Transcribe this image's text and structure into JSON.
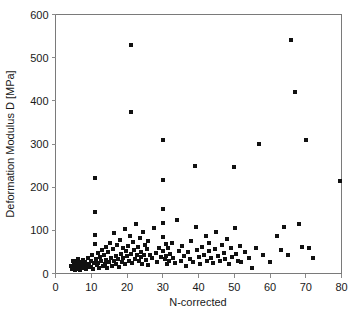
{
  "chart_data": {
    "type": "scatter",
    "title": "",
    "xlabel": "N-corrected",
    "ylabel": "Deformation Modulus D [MPa]",
    "xlim": [
      0,
      80
    ],
    "ylim": [
      0,
      600
    ],
    "xticks": [
      0,
      10,
      20,
      30,
      40,
      50,
      60,
      70,
      80
    ],
    "yticks": [
      0,
      100,
      200,
      300,
      400,
      500,
      600
    ],
    "grid": false,
    "legend": null,
    "marker": {
      "shape": "square",
      "color": "#111111",
      "size": 4
    },
    "series": [
      {
        "name": "Deformation modulus vs N-corrected",
        "points": [
          [
            4.4,
            18
          ],
          [
            4.6,
            10
          ],
          [
            4.8,
            28
          ],
          [
            5.0,
            14
          ],
          [
            5.2,
            22
          ],
          [
            5.4,
            8
          ],
          [
            5.6,
            30
          ],
          [
            5.8,
            16
          ],
          [
            6.0,
            24
          ],
          [
            6.2,
            11
          ],
          [
            6.4,
            34
          ],
          [
            6.6,
            19
          ],
          [
            6.8,
            9
          ],
          [
            7.0,
            26
          ],
          [
            7.2,
            15
          ],
          [
            7.4,
            21
          ],
          [
            7.6,
            32
          ],
          [
            7.8,
            12
          ],
          [
            8.0,
            18
          ],
          [
            8.2,
            27
          ],
          [
            8.5,
            10
          ],
          [
            8.8,
            23
          ],
          [
            9.0,
            36
          ],
          [
            9.2,
            14
          ],
          [
            9.5,
            20
          ],
          [
            9.8,
            29
          ],
          [
            10.0,
            16
          ],
          [
            10.2,
            42
          ],
          [
            10.5,
            11
          ],
          [
            10.8,
            25
          ],
          [
            11.0,
            222
          ],
          [
            11.0,
            143
          ],
          [
            11.0,
            90
          ],
          [
            11.0,
            68
          ],
          [
            11.2,
            33
          ],
          [
            11.5,
            19
          ],
          [
            11.8,
            47
          ],
          [
            12.0,
            24
          ],
          [
            12.2,
            13
          ],
          [
            12.5,
            38
          ],
          [
            12.8,
            28
          ],
          [
            13.0,
            55
          ],
          [
            13.2,
            17
          ],
          [
            13.5,
            44
          ],
          [
            13.8,
            22
          ],
          [
            14.0,
            62
          ],
          [
            14.2,
            31
          ],
          [
            14.5,
            12
          ],
          [
            14.8,
            49
          ],
          [
            15.0,
            26
          ],
          [
            15.3,
            71
          ],
          [
            15.5,
            35
          ],
          [
            15.8,
            18
          ],
          [
            16.0,
            57
          ],
          [
            16.3,
            29
          ],
          [
            16.5,
            94
          ],
          [
            16.8,
            41
          ],
          [
            17.0,
            23
          ],
          [
            17.3,
            66
          ],
          [
            17.5,
            33
          ],
          [
            17.8,
            15
          ],
          [
            18.0,
            78
          ],
          [
            18.3,
            46
          ],
          [
            18.5,
            27
          ],
          [
            18.8,
            59
          ],
          [
            19.0,
            36
          ],
          [
            19.3,
            102
          ],
          [
            19.5,
            21
          ],
          [
            19.8,
            51
          ],
          [
            20.0,
            40
          ],
          [
            20.3,
            64
          ],
          [
            20.5,
            30
          ],
          [
            20.8,
            88
          ],
          [
            21.0,
            530
          ],
          [
            21.0,
            375
          ],
          [
            21.2,
            45
          ],
          [
            21.5,
            25
          ],
          [
            21.8,
            72
          ],
          [
            22.0,
            54
          ],
          [
            22.3,
            34
          ],
          [
            22.5,
            115
          ],
          [
            22.8,
            43
          ],
          [
            23.0,
            61
          ],
          [
            23.3,
            28
          ],
          [
            23.5,
            83
          ],
          [
            23.8,
            38
          ],
          [
            24.0,
            50
          ],
          [
            24.3,
            23
          ],
          [
            24.5,
            97
          ],
          [
            24.8,
            42
          ],
          [
            25.0,
            67
          ],
          [
            25.3,
            31
          ],
          [
            25.5,
            56
          ],
          [
            25.8,
            20
          ],
          [
            26.0,
            75
          ],
          [
            26.5,
            44
          ],
          [
            27.0,
            35
          ],
          [
            27.5,
            105
          ],
          [
            28.0,
            48
          ],
          [
            28.5,
            26
          ],
          [
            29.0,
            60
          ],
          [
            29.5,
            39
          ],
          [
            30.0,
            310
          ],
          [
            30.0,
            217
          ],
          [
            30.0,
            150
          ],
          [
            30.0,
            118
          ],
          [
            30.0,
            85
          ],
          [
            30.2,
            52
          ],
          [
            30.5,
            33
          ],
          [
            30.8,
            68
          ],
          [
            31.0,
            41
          ],
          [
            31.3,
            22
          ],
          [
            31.5,
            58
          ],
          [
            31.8,
            30
          ],
          [
            32.0,
            46
          ],
          [
            32.5,
            71
          ],
          [
            33.0,
            36
          ],
          [
            33.5,
            25
          ],
          [
            34.0,
            124
          ],
          [
            34.5,
            53
          ],
          [
            35.0,
            29
          ],
          [
            35.5,
            64
          ],
          [
            36.0,
            40
          ],
          [
            36.5,
            18
          ],
          [
            37.0,
            49
          ],
          [
            37.5,
            33
          ],
          [
            38.0,
            76
          ],
          [
            38.5,
            27
          ],
          [
            39.0,
            250
          ],
          [
            39.2,
            108
          ],
          [
            39.5,
            55
          ],
          [
            40.0,
            38
          ],
          [
            40.5,
            21
          ],
          [
            41.0,
            62
          ],
          [
            41.5,
            44
          ],
          [
            42.0,
            88
          ],
          [
            42.3,
            30
          ],
          [
            42.8,
            51
          ],
          [
            43.0,
            70
          ],
          [
            43.5,
            35
          ],
          [
            44.0,
            24
          ],
          [
            44.5,
            57
          ],
          [
            45.0,
            96
          ],
          [
            45.5,
            41
          ],
          [
            46.0,
            28
          ],
          [
            46.5,
            66
          ],
          [
            47.0,
            47
          ],
          [
            47.5,
            33
          ],
          [
            48.0,
            79
          ],
          [
            48.5,
            22
          ],
          [
            49.0,
            58
          ],
          [
            49.5,
            38
          ],
          [
            50.0,
            247
          ],
          [
            50.2,
            106
          ],
          [
            50.5,
            45
          ],
          [
            51.0,
            30
          ],
          [
            51.5,
            63
          ],
          [
            52.0,
            26
          ],
          [
            53.0,
            50
          ],
          [
            54.0,
            35
          ],
          [
            55.0,
            12
          ],
          [
            56.0,
            60
          ],
          [
            57.0,
            300
          ],
          [
            58.0,
            42
          ],
          [
            60.0,
            27
          ],
          [
            62.0,
            86
          ],
          [
            63.0,
            55
          ],
          [
            64.0,
            107
          ],
          [
            65.0,
            44
          ],
          [
            66.0,
            540
          ],
          [
            67.0,
            420
          ],
          [
            68.0,
            115
          ],
          [
            69.0,
            62
          ],
          [
            70.0,
            310
          ],
          [
            71.0,
            58
          ],
          [
            72.0,
            36
          ],
          [
            79.5,
            215
          ]
        ]
      }
    ]
  },
  "axes": {
    "y_title": "Deformation Modulus D [MPa]",
    "x_title": "N-corrected",
    "y_labels": [
      "0",
      "100",
      "200",
      "300",
      "400",
      "500",
      "600"
    ],
    "x_labels": [
      "0",
      "10",
      "20",
      "30",
      "40",
      "50",
      "60",
      "70",
      "80"
    ]
  }
}
